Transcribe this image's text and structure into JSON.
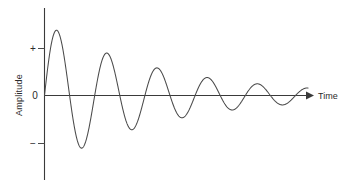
{
  "chart_data": {
    "type": "line",
    "title": "",
    "subtitle": "",
    "xlabel": "Time",
    "ylabel": "Amplitude",
    "x_tick_labels": [],
    "y_tick_labels": [
      "+",
      "0",
      "−"
    ],
    "y_tick_values": [
      1,
      0,
      -1
    ],
    "ylim": [
      -1.45,
      1.45
    ],
    "xlim": [
      0,
      5.25
    ],
    "grid": false,
    "legend": null,
    "annotations": [],
    "series": [
      {
        "name": "damped-sine",
        "equation": "A(t) = A0 * exp(-k*t) * sin(2*pi*t/T)",
        "initial_amplitude": 1.45,
        "decay_constant": 0.43,
        "period": 1.0,
        "phase": 0,
        "color": "#4a4a4a",
        "x": [
          0.0,
          0.25,
          0.5,
          0.75,
          1.0,
          1.25,
          1.5,
          1.75,
          2.0,
          2.25,
          2.5,
          2.75,
          3.0,
          3.25,
          3.5,
          3.75,
          4.0,
          4.25,
          4.5,
          4.75,
          5.0,
          5.25
        ],
        "values": [
          0.0,
          1.45,
          0.0,
          -1.37,
          0.0,
          1.13,
          0.0,
          -1.06,
          0.0,
          0.8,
          0.0,
          -0.74,
          0.0,
          0.58,
          0.0,
          -0.5,
          0.0,
          0.46,
          0.0,
          -0.4,
          0.0,
          0.0
        ],
        "peaks": [
          {
            "index": 1,
            "x": 0.25,
            "y": 1.45
          },
          {
            "index": 2,
            "x": 1.25,
            "y": 1.13
          },
          {
            "index": 3,
            "x": 2.25,
            "y": 0.8
          },
          {
            "index": 4,
            "x": 3.25,
            "y": 0.58
          },
          {
            "index": 5,
            "x": 4.25,
            "y": 0.46
          }
        ],
        "troughs": [
          {
            "index": 1,
            "x": 0.75,
            "y": -1.37
          },
          {
            "index": 2,
            "x": 1.75,
            "y": -1.06
          },
          {
            "index": 3,
            "x": 2.75,
            "y": -0.74
          },
          {
            "index": 4,
            "x": 3.75,
            "y": -0.5
          },
          {
            "index": 5,
            "x": 4.75,
            "y": -0.4
          }
        ]
      }
    ],
    "axes": {
      "x_axis_arrow": true,
      "y_axis_arrow": false,
      "x_axis_label_position": "right-end",
      "y_axis_label_position": "rotated-left"
    },
    "colors": {
      "axis": "#3a3a3a",
      "curve": "#4a4a4a",
      "text": "#2b2b2b",
      "background": "#ffffff"
    }
  },
  "figure": {
    "x_axis_label": "Time",
    "y_axis_label": "Amplitude",
    "tick_plus": "+",
    "tick_zero": "0",
    "tick_minus": "−"
  }
}
